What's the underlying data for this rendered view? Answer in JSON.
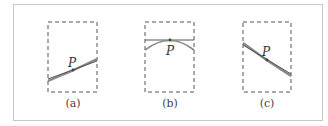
{
  "figure": {
    "panels": [
      {
        "id": "a",
        "caption": "(a)",
        "point_label": "P",
        "description": "line crossing curve at P with slight tilt"
      },
      {
        "id": "b",
        "caption": "(b)",
        "point_label": "P",
        "description": "horizontal tangent line touching arc at P"
      },
      {
        "id": "c",
        "caption": "(c)",
        "point_label": "P",
        "description": "line nearly coincident with curve through P"
      }
    ],
    "colors": {
      "frame": "#c8c8c8",
      "dashed_box": "#555555",
      "curve": "#777777",
      "line": "#555555"
    }
  }
}
